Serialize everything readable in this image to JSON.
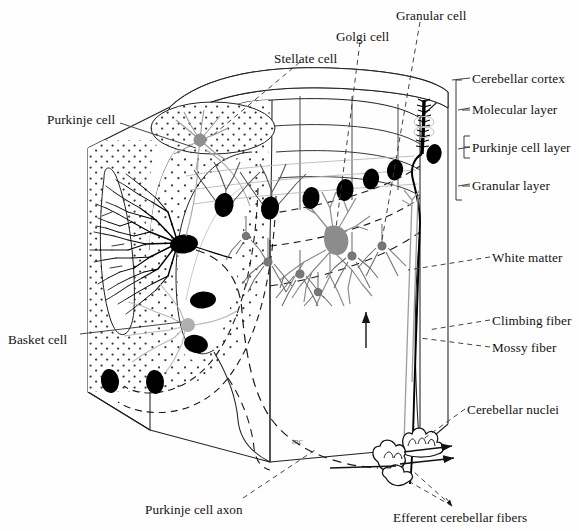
{
  "figure": {
    "type": "anatomical-line-diagram",
    "signature": "mc"
  },
  "palette": {
    "ink": "#161310",
    "line": "#2a2622",
    "purkinje_soma": "#000000",
    "golgi_cell": "#8c8c8c",
    "basket_cell": "#b9b9b9",
    "granule_cell": "#6e6e6e",
    "stellate_cell": "#9a9a9a",
    "stipple": "#3a3a3a",
    "background": "#ffffff"
  },
  "labels": {
    "stellate_cell": "Stellate cell",
    "golgi_cell": "Golgi cell",
    "granular_cell": "Granular cell",
    "purkinje_cell": "Purkinje cell",
    "basket_cell": "Basket cell",
    "purkinje_cell_axon": "Purkinje cell axon",
    "cerebellar_cortex": "Cerebellar cortex",
    "molecular_layer": "Molecular layer",
    "purkinje_cell_layer": "Purkinje cell layer",
    "granular_layer": "Granular layer",
    "white_matter": "White matter",
    "climbing_fiber": "Climbing fiber",
    "mossy_fiber": "Mossy fiber",
    "cerebellar_nuclei": "Cerebellar nuclei",
    "efferent_cerebellar_fibers": "Efferent cerebellar fibers"
  },
  "label_positions": {
    "stellate_cell": {
      "x": 274,
      "y": 52,
      "anchor": "start"
    },
    "golgi_cell": {
      "x": 336,
      "y": 30,
      "anchor": "start"
    },
    "granular_cell": {
      "x": 396,
      "y": 9,
      "anchor": "start"
    },
    "purkinje_cell": {
      "x": 47,
      "y": 113,
      "anchor": "start"
    },
    "basket_cell": {
      "x": 8,
      "y": 333,
      "anchor": "start"
    },
    "purkinje_cell_axon": {
      "x": 145,
      "y": 503,
      "anchor": "start"
    },
    "cerebellar_cortex": {
      "x": 472,
      "y": 74,
      "anchor": "start"
    },
    "molecular_layer": {
      "x": 472,
      "y": 104,
      "anchor": "start"
    },
    "purkinje_cell_layer": {
      "x": 472,
      "y": 143,
      "anchor": "start"
    },
    "granular_layer": {
      "x": 472,
      "y": 180,
      "anchor": "start"
    },
    "white_matter": {
      "x": 492,
      "y": 253,
      "anchor": "start"
    },
    "climbing_fiber": {
      "x": 492,
      "y": 316,
      "anchor": "start"
    },
    "mossy_fiber": {
      "x": 492,
      "y": 343,
      "anchor": "start"
    },
    "cerebellar_nuclei": {
      "x": 467,
      "y": 405,
      "anchor": "start"
    },
    "efferent_cerebellar_fibers": {
      "x": 393,
      "y": 513,
      "anchor": "start"
    }
  },
  "layers": {
    "bracket_x": 455,
    "entries": [
      {
        "name": "Cerebellar cortex",
        "from": 80,
        "to": 200,
        "tick": 80
      },
      {
        "name": "Molecular layer",
        "from": 88,
        "to": 132,
        "tick": 110
      },
      {
        "name": "Purkinje cell layer",
        "from": 134,
        "to": 155,
        "tick": 149
      },
      {
        "name": "Granular layer",
        "from": 157,
        "to": 200,
        "tick": 186
      }
    ]
  },
  "cells": {
    "purkinje_somas": [
      {
        "x": 182,
        "y": 243,
        "big": true
      },
      {
        "x": 224,
        "y": 205
      },
      {
        "x": 270,
        "y": 208
      },
      {
        "x": 203,
        "y": 300
      },
      {
        "x": 196,
        "y": 344
      },
      {
        "x": 110,
        "y": 380
      },
      {
        "x": 155,
        "y": 382
      },
      {
        "x": 311,
        "y": 198
      },
      {
        "x": 345,
        "y": 190
      },
      {
        "x": 371,
        "y": 178
      },
      {
        "x": 393,
        "y": 170
      },
      {
        "x": 411,
        "y": 155
      }
    ],
    "golgi_cell": {
      "x": 335,
      "y": 237
    },
    "stellate_cell": {
      "x": 198,
      "y": 140
    },
    "granule_cells": [
      {
        "x": 268,
        "y": 262
      },
      {
        "x": 300,
        "y": 272
      },
      {
        "x": 352,
        "y": 255
      },
      {
        "x": 380,
        "y": 245
      },
      {
        "x": 246,
        "y": 235
      },
      {
        "x": 318,
        "y": 290
      }
    ],
    "climbing_fiber_target": {
      "x": 424,
      "y": 130
    },
    "mossy_fiber_arrow": {
      "x": 366,
      "y": 320
    }
  },
  "legend_note": {
    "dotted_region": "granular layer stipple",
    "dashed_lines": "layer boundaries"
  }
}
